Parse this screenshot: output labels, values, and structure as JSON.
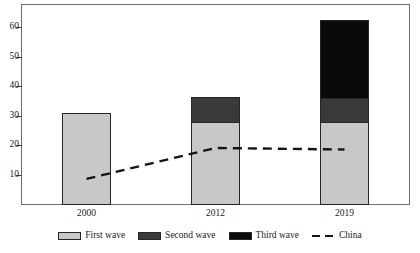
{
  "chart_data": {
    "type": "bar",
    "subtype": "stacked-bar-with-line-overlay",
    "title": "",
    "xlabel": "",
    "ylabel": "",
    "categories": [
      "2000",
      "2012",
      "2019"
    ],
    "series": [
      {
        "name": "First wave",
        "values": [
          31,
          27.8,
          27.8
        ],
        "color": "#c8c8c8",
        "stacked": true
      },
      {
        "name": "Second wave",
        "values": [
          0,
          8.6,
          8.3
        ],
        "color": "#3a3a3a",
        "stacked": true
      },
      {
        "name": "Third wave",
        "values": [
          0,
          0,
          26.3
        ],
        "color": "#0a0a0a",
        "stacked": true
      }
    ],
    "overlay_series": [
      {
        "name": "China",
        "type": "line",
        "style": "dashed",
        "values": [
          8.5,
          19,
          18.5
        ],
        "color": "#141414"
      }
    ],
    "totals": [
      31,
      36.4,
      62.4
    ],
    "ylim": [
      0,
      67.5
    ],
    "yticks": [
      10,
      20,
      30,
      40,
      50,
      60
    ],
    "ytick_labels": [
      "10",
      "20",
      "30",
      "40",
      "50",
      "60"
    ],
    "grid": false,
    "legend_position": "bottom"
  },
  "axes": {
    "y_tick_labels": [
      "60",
      "50",
      "40",
      "30",
      "20",
      "10"
    ],
    "x_tick_labels": [
      "2000",
      "2012",
      "2019"
    ]
  },
  "legend": {
    "items": [
      {
        "label": "First wave",
        "marker": "swatch-light-gray"
      },
      {
        "label": "Second wave",
        "marker": "swatch-dark-gray"
      },
      {
        "label": "Third wave",
        "marker": "swatch-black"
      },
      {
        "label": "China",
        "marker": "dashed-line"
      }
    ]
  },
  "title_strip": {
    "text": ""
  },
  "colors": {
    "first_wave": "#c8c8c8",
    "second_wave": "#3a3a3a",
    "third_wave": "#0a0a0a",
    "china_line": "#141414",
    "frame": "#6e6e6e",
    "text": "#1a1a1a"
  }
}
